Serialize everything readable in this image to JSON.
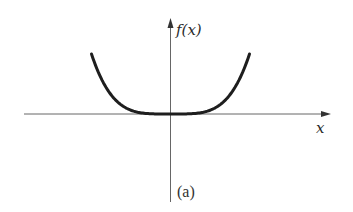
{
  "figure": {
    "caption": "(a)",
    "y_axis_label": "f(x)",
    "x_axis_label": "x"
  },
  "colors": {
    "axis": "#555555",
    "curve": "#1e1e1e",
    "text": "#2a2a2a",
    "background": "#ffffff"
  },
  "chart_data": {
    "type": "line",
    "title": "",
    "caption": "(a)",
    "xlabel": "x",
    "ylabel": "f(x)",
    "function_shape": "even, very flat near origin (quartic-like, f(x) ~ x^4)",
    "grid": false,
    "legend": null,
    "ticks": {
      "x": [],
      "y": []
    },
    "xlim": [
      -1.6,
      1.75
    ],
    "ylim": [
      -1.6,
      1.7
    ],
    "series": [
      {
        "name": "f(x)",
        "x": [
          -1.0,
          -0.9,
          -0.8,
          -0.7,
          -0.6,
          -0.5,
          -0.4,
          -0.3,
          -0.2,
          -0.1,
          0.0,
          0.1,
          0.2,
          0.3,
          0.4,
          0.5,
          0.6,
          0.7,
          0.8,
          0.9,
          1.0
        ],
        "y": [
          1.0,
          0.656,
          0.41,
          0.24,
          0.13,
          0.0625,
          0.0256,
          0.0081,
          0.0016,
          0.0001,
          0.0,
          0.0001,
          0.0016,
          0.0081,
          0.0256,
          0.0625,
          0.13,
          0.24,
          0.41,
          0.656,
          1.0
        ]
      }
    ]
  }
}
